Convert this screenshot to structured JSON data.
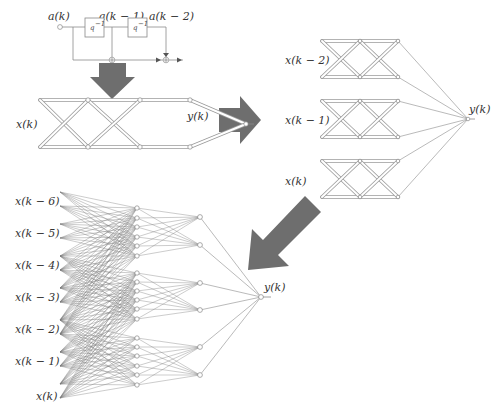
{
  "colors": {
    "arrow": "#6e6e6e",
    "line": "#8a8a8a",
    "node_fill": "#ffffff",
    "text": "#333333"
  },
  "filter": {
    "labels": {
      "input": "a(k)",
      "tap1": "a(k − 1)",
      "tap2": "a(k − 2)"
    },
    "delay_label": "q",
    "delay_exponent": "−1",
    "delay_blocks": 2,
    "input_node": [
      60,
      27
    ],
    "boxes": [
      [
        85,
        18,
        19,
        19
      ],
      [
        128,
        18,
        19,
        19
      ]
    ],
    "sum_nodes": [
      [
        112,
        60
      ],
      [
        166,
        60
      ]
    ]
  },
  "arrows": {
    "down": {
      "points": "99,63 126,63 126,77 135,77 112,99 90,77 99,77"
    },
    "right": {
      "points": "219,108 240,108 240,96 261,120 240,144 240,132 219,132"
    },
    "diag": {
      "points": "305,196 321,212 278,255 289,266 248,270 252,229 263,240"
    }
  },
  "lattice_single": {
    "input_label": "x(k)",
    "output_label": "y(k)",
    "top_y": 100,
    "bottom_y": 147,
    "columns_x": [
      40,
      88,
      140,
      190
    ],
    "output_node": [
      246,
      124
    ]
  },
  "lattice_triple": {
    "output_label": "y(k)",
    "columns_x": [
      322,
      360,
      398
    ],
    "output_node": [
      468,
      119
    ],
    "blocks": [
      {
        "label": "x(k − 2)",
        "top_y": 41,
        "bottom_y": 77
      },
      {
        "label": "x(k − 1)",
        "top_y": 101,
        "bottom_y": 137
      },
      {
        "label": "x(k)",
        "top_y": 161,
        "bottom_y": 197
      }
    ]
  },
  "network": {
    "output_label": "y(k)",
    "input_x": 60,
    "inputs": [
      {
        "label": "x(k − 6)",
        "ys": [
          192,
          206
        ]
      },
      {
        "label": "x(k − 5)",
        "ys": [
          224,
          238
        ]
      },
      {
        "label": "x(k − 4)",
        "ys": [
          256,
          270
        ]
      },
      {
        "label": "x(k − 3)",
        "ys": [
          288,
          302
        ]
      },
      {
        "label": "x(k − 2)",
        "ys": [
          320,
          334
        ]
      },
      {
        "label": "x(k − 1)",
        "ys": [
          352,
          366
        ]
      },
      {
        "label": "x(k)",
        "ys": [
          384,
          398
        ]
      }
    ],
    "hidden1_x": 137,
    "hidden1_groups": [
      [
        208,
        218,
        227,
        237,
        246,
        256
      ],
      [
        273,
        282,
        291,
        300,
        309,
        319
      ],
      [
        338,
        347,
        356,
        366,
        375,
        385
      ]
    ],
    "hidden2_x": 200,
    "hidden2_ys": [
      217,
      245,
      283,
      310,
      347,
      375
    ],
    "output_node": [
      261,
      297
    ]
  }
}
